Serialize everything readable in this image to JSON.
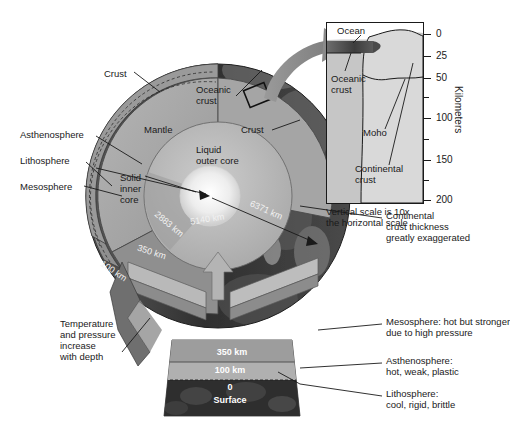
{
  "figure": {
    "background": "#ffffff"
  },
  "globe": {
    "layer_labels": [
      {
        "id": "crust",
        "text": "Crust",
        "x": 104,
        "y": 68
      },
      {
        "id": "oceanic-crust",
        "text": "Oceanic\ncrust",
        "x": 196,
        "y": 84
      },
      {
        "id": "mantle",
        "text": "Mantle",
        "x": 144,
        "y": 124
      },
      {
        "id": "crust-right",
        "text": "Crust",
        "x": 241,
        "y": 124
      },
      {
        "id": "liquid-outer",
        "text": "Liquid\nouter core",
        "x": 196,
        "y": 144
      },
      {
        "id": "solid-inner",
        "text": "Solid\ninner\ncore",
        "x": 120,
        "y": 172
      },
      {
        "id": "asthenosphere",
        "text": "Asthenosphere",
        "x": 20,
        "y": 129
      },
      {
        "id": "lithosphere",
        "text": "Lithosphere",
        "x": 20,
        "y": 155
      },
      {
        "id": "mesosphere",
        "text": "Mesosphere",
        "x": 20,
        "y": 181
      }
    ],
    "radius_labels": [
      {
        "id": "inner-core-radius",
        "text": "5140 km",
        "x": 190,
        "y": 214
      },
      {
        "id": "earth-radius",
        "text": "6371 km",
        "x": 249,
        "y": 205
      },
      {
        "id": "core-mantle-depth",
        "text": "2883 km",
        "x": 152,
        "y": 219
      },
      {
        "id": "asthenosphere-depth",
        "text": "350 km",
        "x": 137,
        "y": 247
      },
      {
        "id": "lithosphere-depth",
        "text": "100 km",
        "x": 99,
        "y": 266
      }
    ],
    "temperature_note": "Temperature\nand pressure\nincrease\nwith depth",
    "column_labels": [
      {
        "id": "col-350",
        "text": "350 km",
        "y": 354
      },
      {
        "id": "col-100",
        "text": "100 km",
        "y": 371
      },
      {
        "id": "col-0",
        "text": "0",
        "y": 387
      },
      {
        "id": "col-surface",
        "text": "Surface",
        "y": 399
      }
    ]
  },
  "annotations_right": [
    {
      "id": "continental-thickness",
      "text": "Continental\ncrust thickness\ngreatly exaggerated",
      "x": 386,
      "y": 214
    },
    {
      "id": "mesosphere-desc",
      "text": "Mesosphere: hot but stronger\ndue to high pressure",
      "x": 386,
      "y": 320
    },
    {
      "id": "asthenosphere-desc",
      "text": "Asthenosphere:\nhot, weak, plastic",
      "x": 386,
      "y": 359
    },
    {
      "id": "lithosphere-desc",
      "text": "Lithosphere:\ncool, rigid, brittle",
      "x": 386,
      "y": 392
    }
  ],
  "inset": {
    "labels": [
      {
        "id": "ocean",
        "text": "Ocean",
        "x": 10,
        "y": 4
      },
      {
        "id": "oceanic-crust",
        "text": "Oceanic\ncrust",
        "x": 6,
        "y": 52
      },
      {
        "id": "moho",
        "text": "Moho",
        "x": 38,
        "y": 110
      },
      {
        "id": "continental-crust",
        "text": "Continental\ncrust",
        "x": 30,
        "y": 144
      }
    ],
    "axis_title": "Kilometers",
    "ticks": [
      {
        "value": "0",
        "y": 14,
        "labeled": true
      },
      {
        "value": "25",
        "y": 36,
        "labeled": true
      },
      {
        "value": "50",
        "y": 58,
        "labeled": true
      },
      {
        "value": "",
        "y": 76,
        "labeled": false
      },
      {
        "value": "100",
        "y": 98,
        "labeled": true
      },
      {
        "value": "",
        "y": 119,
        "labeled": false
      },
      {
        "value": "150",
        "y": 140,
        "labeled": true
      },
      {
        "value": "",
        "y": 160,
        "labeled": false
      },
      {
        "value": "200",
        "y": 180,
        "labeled": true
      }
    ],
    "scale_note": "Vertical scale is 10x\nthe horizontal scale"
  },
  "colors": {
    "mantle": "#a9a9a9",
    "outer_core": "#bdbdbd",
    "inner_core": "#f4f4f4",
    "lithosphere": "#8d8d8d",
    "surface_rock": "#3a3a3a",
    "arrow": "#8a8a8a",
    "inset_fill": "#c9c9c9",
    "oceanic_crust_band": "#4a4a4a"
  }
}
